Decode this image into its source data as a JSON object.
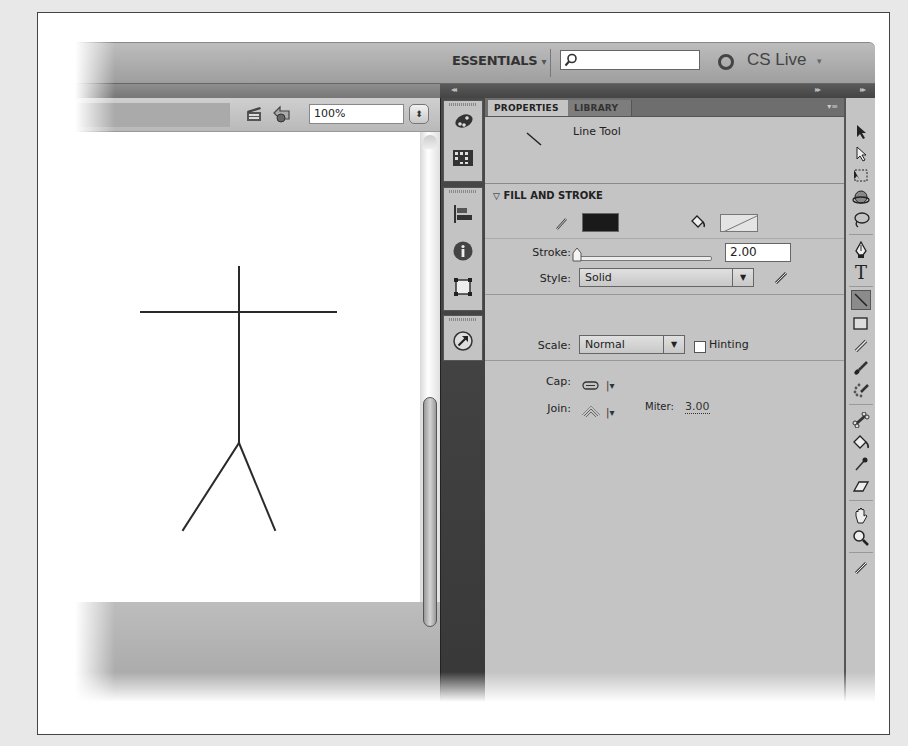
{
  "header": {
    "workspace_label": "ESSENTIALS",
    "workspace_arrow": "▾",
    "search_placeholder": "",
    "cs_live_label": "CS Live",
    "cs_live_arrow": "▾"
  },
  "panel_collapse": {
    "left_arrows": "◂◂",
    "right_arrows": "▸▸",
    "far_right_arrows": "▸▸"
  },
  "stage_toolbar": {
    "zoom_value": "100%",
    "stepper_glyph": "⬍"
  },
  "stage": {
    "drawing": "stick-figure",
    "lines": [
      {
        "x1": 164,
        "y1": 135,
        "x2": 164,
        "y2": 311
      },
      {
        "x1": 66,
        "y1": 180,
        "x2": 261,
        "y2": 180
      },
      {
        "x1": 164,
        "y1": 311,
        "x2": 108,
        "y2": 398
      },
      {
        "x1": 164,
        "y1": 311,
        "x2": 200,
        "y2": 398
      }
    ]
  },
  "panel": {
    "tabs": [
      {
        "label": "PROPERTIES",
        "active": true
      },
      {
        "label": "LIBRARY",
        "active": false
      }
    ],
    "menu_glyph": "▾≡",
    "tool_name": "Line Tool",
    "section_title": "FILL AND STROKE",
    "section_toggle": "▽",
    "stroke_color": "#1a1a1a",
    "fill_color": "none",
    "stroke_label": "Stroke:",
    "stroke_value": "2.00",
    "style_label": "Style:",
    "style_value": "Solid",
    "scale_label": "Scale:",
    "scale_value": "Normal",
    "hinting_label": "Hinting",
    "hinting_checked": false,
    "cap_label": "Cap:",
    "join_label": "Join:",
    "miter_label": "Miter:",
    "miter_value": "3.00",
    "caret": "▼",
    "small_caret": "|▾"
  },
  "dock_icons": [
    "color-icon",
    "swatches-icon",
    "align-icon",
    "info-icon",
    "transform-icon",
    "motion-presets-icon"
  ],
  "tools": [
    "selection-tool",
    "subselection-tool",
    "free-transform-tool",
    "3d-rotation-tool",
    "lasso-tool",
    "pen-tool",
    "text-tool",
    "line-tool",
    "rectangle-tool",
    "pencil-tool",
    "brush-tool",
    "deco-tool",
    "bone-tool",
    "paint-bucket-tool",
    "eyedropper-tool",
    "eraser-tool",
    "hand-tool",
    "zoom-tool",
    "stroke-color-tool"
  ],
  "selected_tool": "line-tool",
  "text_tool_glyph": "T"
}
